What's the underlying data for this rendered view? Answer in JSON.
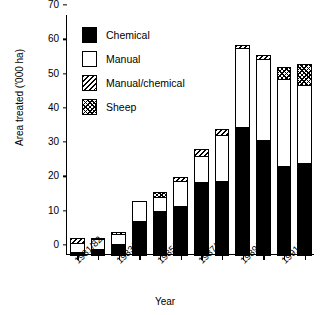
{
  "chart_data": {
    "type": "bar",
    "stacked": true,
    "title": "",
    "xlabel": "Year",
    "ylabel": "Area treated ('000 ha)",
    "ylim": [
      0,
      70
    ],
    "yticks": [
      0,
      10,
      20,
      30,
      40,
      50,
      60,
      70
    ],
    "grid": false,
    "legend_position": "top-left",
    "categories": [
      "1981/82",
      "1982/83",
      "1983/84",
      "1984/85",
      "1985/86",
      "1986/87",
      "1987/88",
      "1988/89",
      "1989/90",
      "1990/91",
      "1991/92",
      "1992/93"
    ],
    "tick_labels": [
      "1981/82",
      "1983/84",
      "1985/86",
      "1987/88",
      "1989/90",
      "1991/92"
    ],
    "tick_label_indices": [
      0,
      2,
      4,
      6,
      8,
      10
    ],
    "series": [
      {
        "name": "Chemical",
        "pattern": "solid-black",
        "color": "#000000",
        "values": [
          1.1,
          2.1,
          3.4,
          10.3,
          13.0,
          14.7,
          21.6,
          21.8,
          37.5,
          33.9,
          26.3,
          27.2
        ]
      },
      {
        "name": "Manual",
        "pattern": "white",
        "color": "#ffffff",
        "values": [
          3.1,
          3.2,
          3.3,
          6.1,
          4.5,
          7.4,
          7.8,
          13.8,
          23.5,
          24.0,
          25.6,
          22.9
        ]
      },
      {
        "name": "Manual/chemical",
        "pattern": "diagonal-hatch",
        "color": "#ffffff",
        "values": [
          1.5,
          0.0,
          0.0,
          0.0,
          0.0,
          1.4,
          2.3,
          2.0,
          1.0,
          1.4,
          0.0,
          0.0
        ]
      },
      {
        "name": "Sheep",
        "pattern": "crosshatch",
        "color": "#ffffff",
        "values": [
          0.0,
          0.4,
          0.8,
          0.0,
          1.7,
          0.0,
          0.0,
          0.0,
          0.0,
          0.0,
          3.7,
          6.5
        ]
      }
    ],
    "totals": [
      5.7,
      5.7,
      7.5,
      16.4,
      19.2,
      23.5,
      31.7,
      37.6,
      62.0,
      59.3,
      55.6,
      56.6
    ]
  },
  "legend": {
    "items": [
      {
        "label": "Chemical",
        "key": "chemical"
      },
      {
        "label": "Manual",
        "key": "manual"
      },
      {
        "label": "Manual/chemical",
        "key": "mc"
      },
      {
        "label": "Sheep",
        "key": "sheep"
      }
    ]
  }
}
